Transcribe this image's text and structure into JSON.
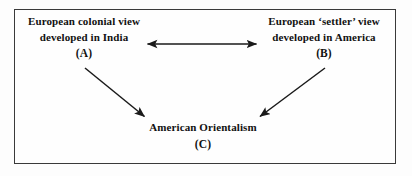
{
  "diagram": {
    "title_present": false,
    "frame": {
      "border_color": "#3a3a3a",
      "background": "#fefefe"
    },
    "nodes": [
      {
        "id": "A",
        "line1": "European colonial view",
        "line2": "developed in India",
        "tag": "(A)"
      },
      {
        "id": "B",
        "line1": "European ‘settler’ view",
        "line2": "developed in America",
        "tag": "(B)"
      },
      {
        "id": "C",
        "line1": "American Orientalism",
        "line2": "",
        "tag": "(C)"
      }
    ],
    "connectors": [
      {
        "name": "a-b-bidirectional-arrow",
        "from": "A",
        "to": "B",
        "style": "double-headed",
        "orientation": "horizontal",
        "color": "#1a1a1a"
      },
      {
        "name": "a-to-c-arrow",
        "from": "A",
        "to": "C",
        "style": "single-headed",
        "orientation": "diagonal-down-right",
        "color": "#1a1a1a"
      },
      {
        "name": "b-to-c-arrow",
        "from": "B",
        "to": "C",
        "style": "single-headed",
        "orientation": "diagonal-down-left",
        "color": "#1a1a1a"
      }
    ]
  }
}
